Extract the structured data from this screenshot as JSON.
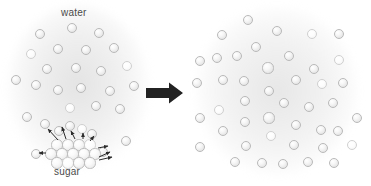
{
  "figure": {
    "width": 371,
    "height": 186,
    "background_color": "#ffffff",
    "type": "science-diagram"
  },
  "labels": {
    "water": "water",
    "sugar": "sugar"
  },
  "colors": {
    "molecule_fill": "#f2f2f2",
    "molecule_stroke": "#b9b9b9",
    "cloud": "#d2d2d2",
    "arrow": "#222222",
    "label_text": "#4a4a4a"
  },
  "panels": {
    "left": {
      "name": "before-dissolving",
      "cloud": {
        "cx": 78,
        "cy": 87,
        "rx": 70,
        "ry": 81
      },
      "water_molecules": [
        {
          "x": 72,
          "y": 28,
          "r": 5.2
        },
        {
          "x": 40,
          "y": 34,
          "r": 5.2
        },
        {
          "x": 99,
          "y": 33,
          "r": 5.2
        },
        {
          "x": 31,
          "y": 54,
          "r": 5.2
        },
        {
          "x": 58,
          "y": 49,
          "r": 5.2
        },
        {
          "x": 86,
          "y": 50,
          "r": 5.2
        },
        {
          "x": 114,
          "y": 48,
          "r": 5.2
        },
        {
          "x": 47,
          "y": 69,
          "r": 5.2
        },
        {
          "x": 76,
          "y": 68,
          "r": 5.2
        },
        {
          "x": 101,
          "y": 71,
          "r": 5.2
        },
        {
          "x": 127,
          "y": 66,
          "r": 5.2
        },
        {
          "x": 16,
          "y": 80,
          "r": 5.2
        },
        {
          "x": 36,
          "y": 85,
          "r": 5.2
        },
        {
          "x": 58,
          "y": 90,
          "r": 5.2
        },
        {
          "x": 81,
          "y": 88,
          "r": 5.2
        },
        {
          "x": 110,
          "y": 91,
          "r": 5.2
        },
        {
          "x": 134,
          "y": 86,
          "r": 5.2
        },
        {
          "x": 70,
          "y": 108,
          "r": 5.2
        },
        {
          "x": 96,
          "y": 106,
          "r": 5.2
        },
        {
          "x": 120,
          "y": 109,
          "r": 5.2
        },
        {
          "x": 27,
          "y": 117,
          "r": 5.2
        },
        {
          "x": 45,
          "y": 124,
          "r": 5.2
        },
        {
          "x": 59,
          "y": 131,
          "r": 5.2
        },
        {
          "x": 70,
          "y": 126,
          "r": 5.2
        },
        {
          "x": 82,
          "y": 129,
          "r": 5.2
        },
        {
          "x": 92,
          "y": 134,
          "r": 5.2
        },
        {
          "x": 36,
          "y": 154,
          "r": 5.2
        },
        {
          "x": 103,
          "y": 152,
          "r": 5.2
        },
        {
          "x": 126,
          "y": 141,
          "r": 5.2
        }
      ],
      "sugar_crystal": {
        "description": "close-packed hexagonal lattice of sugar molecules",
        "molecules": [
          {
            "x": 57,
            "y": 145,
            "r": 5.6
          },
          {
            "x": 68,
            "y": 145,
            "r": 5.6
          },
          {
            "x": 79,
            "y": 145,
            "r": 5.6
          },
          {
            "x": 90,
            "y": 145,
            "r": 5.6
          },
          {
            "x": 51,
            "y": 154,
            "r": 5.6
          },
          {
            "x": 62,
            "y": 154,
            "r": 5.6
          },
          {
            "x": 73,
            "y": 154,
            "r": 5.6
          },
          {
            "x": 84,
            "y": 154,
            "r": 5.6
          },
          {
            "x": 95,
            "y": 154,
            "r": 5.6
          },
          {
            "x": 57,
            "y": 163,
            "r": 5.6
          },
          {
            "x": 68,
            "y": 163,
            "r": 5.6
          },
          {
            "x": 79,
            "y": 163,
            "r": 5.6
          },
          {
            "x": 90,
            "y": 163,
            "r": 5.6
          }
        ]
      },
      "dissolution_arrows": [
        {
          "x1": 58,
          "y1": 140,
          "x2": 48,
          "y2": 129
        },
        {
          "x1": 66,
          "y1": 139,
          "x2": 62,
          "y2": 127
        },
        {
          "x1": 75,
          "y1": 139,
          "x2": 71,
          "y2": 131
        },
        {
          "x1": 83,
          "y1": 139,
          "x2": 83,
          "y2": 133
        },
        {
          "x1": 90,
          "y1": 141,
          "x2": 94,
          "y2": 136
        },
        {
          "x1": 98,
          "y1": 148,
          "x2": 108,
          "y2": 146
        },
        {
          "x1": 99,
          "y1": 157,
          "x2": 110,
          "y2": 152
        },
        {
          "x1": 99,
          "y1": 160,
          "x2": 112,
          "y2": 157
        },
        {
          "x1": 46,
          "y1": 153,
          "x2": 39,
          "y2": 153
        }
      ]
    },
    "right": {
      "name": "after-dissolving",
      "cloud": {
        "cx": 92,
        "cy": 91,
        "rx": 80,
        "ry": 83
      },
      "molecules": [
        {
          "x": 63,
          "y": 20,
          "r": 5.2
        },
        {
          "x": 37,
          "y": 35,
          "r": 5.2
        },
        {
          "x": 92,
          "y": 31,
          "r": 5.2
        },
        {
          "x": 127,
          "y": 34,
          "r": 5.2
        },
        {
          "x": 154,
          "y": 34,
          "r": 5.2
        },
        {
          "x": 71,
          "y": 47,
          "r": 5.2
        },
        {
          "x": 52,
          "y": 56,
          "r": 5.2
        },
        {
          "x": 32,
          "y": 58,
          "r": 5.2
        },
        {
          "x": 15,
          "y": 61,
          "r": 5.2
        },
        {
          "x": 104,
          "y": 56,
          "r": 5.2
        },
        {
          "x": 154,
          "y": 60,
          "r": 5.2
        },
        {
          "x": 83,
          "y": 68,
          "r": 5.6
        },
        {
          "x": 129,
          "y": 69,
          "r": 5.2
        },
        {
          "x": 12,
          "y": 83,
          "r": 5.2
        },
        {
          "x": 38,
          "y": 80,
          "r": 5.2
        },
        {
          "x": 59,
          "y": 81,
          "r": 5.2
        },
        {
          "x": 111,
          "y": 80,
          "r": 5.2
        },
        {
          "x": 137,
          "y": 84,
          "r": 5.2
        },
        {
          "x": 158,
          "y": 83,
          "r": 5.2
        },
        {
          "x": 84,
          "y": 91,
          "r": 5.2
        },
        {
          "x": 60,
          "y": 101,
          "r": 5.2
        },
        {
          "x": 99,
          "y": 103,
          "r": 5.2
        },
        {
          "x": 124,
          "y": 107,
          "r": 5.2
        },
        {
          "x": 148,
          "y": 103,
          "r": 5.2
        },
        {
          "x": 34,
          "y": 110,
          "r": 5.2
        },
        {
          "x": 15,
          "y": 118,
          "r": 5.2
        },
        {
          "x": 60,
          "y": 122,
          "r": 5.2
        },
        {
          "x": 84,
          "y": 118,
          "r": 5.6
        },
        {
          "x": 111,
          "y": 125,
          "r": 5.2
        },
        {
          "x": 172,
          "y": 118,
          "r": 5.2
        },
        {
          "x": 38,
          "y": 131,
          "r": 5.2
        },
        {
          "x": 86,
          "y": 136,
          "r": 5.2
        },
        {
          "x": 136,
          "y": 130,
          "r": 5.2
        },
        {
          "x": 153,
          "y": 131,
          "r": 5.2
        },
        {
          "x": 15,
          "y": 147,
          "r": 5.2
        },
        {
          "x": 61,
          "y": 146,
          "r": 5.2
        },
        {
          "x": 109,
          "y": 145,
          "r": 5.2
        },
        {
          "x": 138,
          "y": 148,
          "r": 5.2
        },
        {
          "x": 167,
          "y": 145,
          "r": 5.2
        },
        {
          "x": 50,
          "y": 162,
          "r": 5.2
        },
        {
          "x": 77,
          "y": 163,
          "r": 5.2
        },
        {
          "x": 98,
          "y": 164,
          "r": 5.2
        },
        {
          "x": 123,
          "y": 162,
          "r": 5.2
        },
        {
          "x": 149,
          "y": 163,
          "r": 5.2
        }
      ]
    }
  },
  "transition": {
    "arrow_direction": "right",
    "arrow_color": "#222222"
  }
}
